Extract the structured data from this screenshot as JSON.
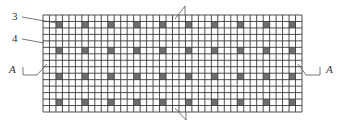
{
  "diagram": {
    "type": "technical-drawing",
    "grid": {
      "x": 43,
      "y": 15,
      "width": 259,
      "height": 97,
      "columns": 40,
      "rows": 15,
      "line_color": "#3a3a3a",
      "background": "#ffffff",
      "filled_color": "#6e6e6e",
      "filled_cells": {
        "columns": [
          2,
          6,
          10,
          14,
          18,
          22,
          26,
          30,
          34,
          38
        ],
        "rows": [
          1,
          5,
          9,
          13
        ]
      }
    },
    "labels": {
      "part_3": "3",
      "part_4": "4",
      "section_left": "A",
      "section_right": "A"
    },
    "leaders": [
      {
        "label": "3",
        "from": [
          22,
          17
        ],
        "to": [
          56,
          23
        ]
      },
      {
        "label": "4",
        "from": [
          22,
          39
        ],
        "to": [
          44,
          43
        ]
      }
    ],
    "section_markers": [
      {
        "side": "left",
        "label": "A",
        "bracket": [
          [
            23,
            67
          ],
          [
            23,
            75
          ],
          [
            37,
            75
          ]
        ],
        "cut": [
          [
            37,
            75
          ],
          [
            47,
            64
          ]
        ]
      },
      {
        "side": "right",
        "label": "A",
        "bracket": [
          [
            320,
            67
          ],
          [
            320,
            75
          ],
          [
            306,
            75
          ]
        ],
        "cut": [
          [
            306,
            75
          ],
          [
            298,
            64
          ]
        ]
      }
    ],
    "break_lines": [
      {
        "position": "top",
        "points": [
          [
            175,
            19
          ],
          [
            185,
            6
          ],
          [
            185,
            15
          ]
        ]
      },
      {
        "position": "bottom",
        "points": [
          [
            175,
            108
          ],
          [
            186,
            120
          ],
          [
            186,
            112
          ]
        ]
      }
    ]
  }
}
